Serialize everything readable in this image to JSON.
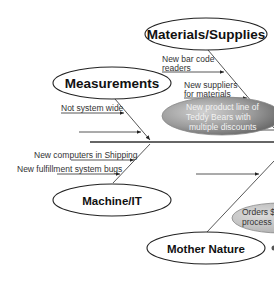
{
  "diagram": {
    "type": "fishbone",
    "categories": {
      "materials": "Materials/Supplies",
      "measurements": "Measurements",
      "machine": "Machine/IT",
      "nature": "Mother Nature"
    },
    "causes": {
      "materials": [
        "New bar code",
        "readers",
        "New suppliers",
        "for materials"
      ],
      "highlight": [
        "New product line of",
        "Teddy Bears with",
        "multiple discounts"
      ],
      "measurements": [
        "Not system wide"
      ],
      "machine": [
        "New computers in Shipping",
        "New fulfillment system bugs"
      ],
      "nature_highlight": [
        "Orders $",
        "process"
      ]
    },
    "colors": {
      "line": "#333333",
      "highlight_dark": "#6e6e6e",
      "highlight_light": "#d9d9d9"
    }
  }
}
